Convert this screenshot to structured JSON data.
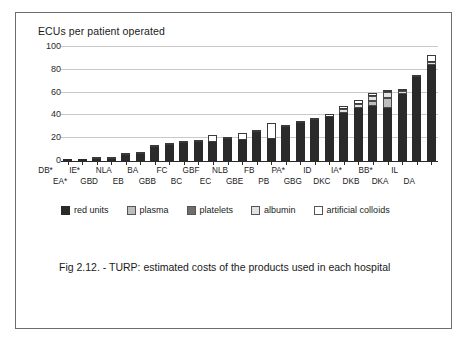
{
  "figure": {
    "y_axis_title": "ECUs per patient operated",
    "caption": "Fig 2.12. - TURP: estimated costs of the products used  in each hospital"
  },
  "legend": {
    "items": [
      {
        "label": "red units",
        "color": "#2a2a2a",
        "swatch_name": "legend-swatch-red-units"
      },
      {
        "label": "plasma",
        "color": "#bdbdbd",
        "swatch_name": "legend-swatch-plasma"
      },
      {
        "label": "platelets",
        "color": "#6e6e6e",
        "swatch_name": "legend-swatch-platelets"
      },
      {
        "label": "albumin",
        "color": "#e2e2e2",
        "swatch_name": "legend-swatch-albumin"
      },
      {
        "label": "artificial colloids",
        "color": "#ffffff",
        "swatch_name": "legend-swatch-artificial-colloids"
      }
    ]
  },
  "chart_data": {
    "type": "bar",
    "subtype": "stacked",
    "title": "Fig 2.12. - TURP: estimated costs of the products used  in each hospital",
    "xlabel": "",
    "ylabel": "ECUs per patient operated",
    "ylim": [
      0,
      100
    ],
    "yticks": [
      0,
      20,
      40,
      60,
      80,
      100
    ],
    "grid": true,
    "legend_position": "below-plot",
    "categories": [
      "DB*",
      "EA*",
      "IE*",
      "GBD",
      "NLA",
      "EB",
      "BA",
      "GBB",
      "FC",
      "BC",
      "GBF",
      "EC",
      "NLB",
      "GBE",
      "FB",
      "PB",
      "PA*",
      "GBG",
      "ID",
      "DKC",
      "IA*",
      "DKB",
      "BB*",
      "DKA",
      "IL",
      "DA"
    ],
    "series": [
      {
        "name": "red units",
        "color": "#2a2a2a",
        "values": [
          0.3,
          0.4,
          1.0,
          1.5,
          4.5,
          6.0,
          12.0,
          13.5,
          15.5,
          16.5,
          16.0,
          19.0,
          18.0,
          25.0,
          19.0,
          29.0,
          33.0,
          35.5,
          38.0,
          42.0,
          46.0,
          48.0,
          46.0,
          58.0,
          73.0,
          84.0
        ]
      },
      {
        "name": "plasma",
        "color": "#bdbdbd",
        "values": [
          0,
          0,
          0,
          0,
          0,
          0,
          0,
          0,
          0,
          0,
          0,
          0,
          0,
          0,
          0,
          0,
          0,
          0,
          0,
          0,
          0,
          4.0,
          9.0,
          0,
          0,
          0
        ]
      },
      {
        "name": "platelets",
        "color": "#6e6e6e",
        "values": [
          0,
          0,
          0,
          0,
          0,
          0,
          0,
          0,
          0,
          0,
          0,
          0,
          0,
          0,
          0,
          0,
          0,
          0,
          0,
          0,
          0,
          0,
          0,
          0,
          0,
          0
        ]
      },
      {
        "name": "albumin",
        "color": "#e2e2e2",
        "values": [
          0,
          0,
          0,
          0,
          0,
          0,
          0,
          0,
          0,
          0,
          0,
          0,
          0,
          0,
          0,
          0,
          0,
          0,
          0,
          3.0,
          4.0,
          5.0,
          5.0,
          3.0,
          0,
          2.0
        ]
      },
      {
        "name": "artificial colloids",
        "color": "#ffffff",
        "values": [
          0,
          0,
          1.5,
          2.0,
          2.5,
          1.5,
          1.0,
          1.0,
          1.0,
          1.0,
          6.0,
          1.0,
          6.0,
          1.0,
          14.0,
          1.0,
          2.0,
          2.0,
          3.0,
          3.0,
          3.0,
          2.0,
          2.0,
          2.0,
          2.0,
          7.0
        ]
      }
    ],
    "totals": [
      0.3,
      0.4,
      2.5,
      3.5,
      7.0,
      7.5,
      13.0,
      14.5,
      16.5,
      17.5,
      22.0,
      20.0,
      24.0,
      26.0,
      33.0,
      30.0,
      35.0,
      37.5,
      41.0,
      48.0,
      53.0,
      59.0,
      62.0,
      63.0,
      75.0,
      93.0
    ]
  }
}
